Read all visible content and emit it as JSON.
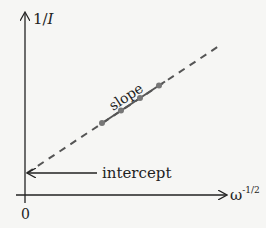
{
  "diagram": {
    "y_axis_label": "1/I",
    "x_axis_label": "ω",
    "x_axis_exponent": "-1/2",
    "origin_label": "0",
    "slope_label": "slope",
    "intercept_label": "intercept",
    "colors": {
      "axis": "#222222",
      "line": "#555555",
      "point": "#777777"
    },
    "points": [
      {
        "x": 102,
        "y": 123
      },
      {
        "x": 120,
        "y": 111
      },
      {
        "x": 139,
        "y": 99
      },
      {
        "x": 158,
        "y": 86
      }
    ]
  }
}
